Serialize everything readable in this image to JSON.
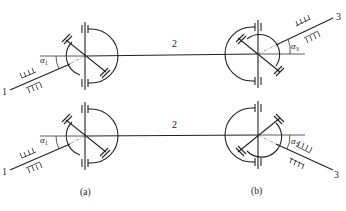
{
  "diagram": {
    "type": "double-cardan-universal-joint-arrangements",
    "rows": [
      {
        "id": "top",
        "left_joint": {
          "cx": 85,
          "cy": 56
        },
        "right_joint": {
          "cx": 258,
          "cy": 54
        },
        "intermediate_shaft_label": "2",
        "input_shaft": {
          "label": "1",
          "angle_label": "α",
          "angle_subscript": "1",
          "direction": "lower-left"
        },
        "output_shaft": {
          "label": "3",
          "angle_label": "α",
          "angle_subscript": "3",
          "direction": "upper-right"
        }
      },
      {
        "id": "bottom",
        "left_joint": {
          "cx": 85,
          "cy": 136
        },
        "right_joint": {
          "cx": 258,
          "cy": 135
        },
        "intermediate_shaft_label": "2",
        "input_shaft": {
          "label": "1",
          "angle_label": "α",
          "angle_subscript": "1",
          "direction": "lower-left"
        },
        "output_shaft": {
          "label": "3",
          "angle_label": "α",
          "angle_subscript": "3",
          "direction": "lower-right"
        }
      }
    ],
    "captions": {
      "left": "(a)",
      "right": "(b)"
    }
  }
}
